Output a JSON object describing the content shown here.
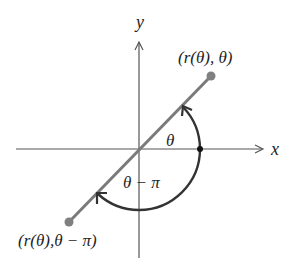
{
  "diagram": {
    "type": "polar-coordinate-symmetry",
    "axes": {
      "x_label": "x",
      "y_label": "y"
    },
    "points": [
      {
        "label": "(r(θ), θ)",
        "position": "upper-right"
      },
      {
        "label": "(r(θ),θ − π)",
        "position": "lower-left"
      }
    ],
    "angles": [
      {
        "label": "θ",
        "direction": "counterclockwise from positive x-axis"
      },
      {
        "label": "θ − π",
        "direction": "clockwise from positive x-axis"
      }
    ],
    "colors": {
      "axis": "#555555",
      "line": "#7a7a7a",
      "point": "#808080",
      "arc": "#333333",
      "text": "#1e1e1e"
    }
  }
}
